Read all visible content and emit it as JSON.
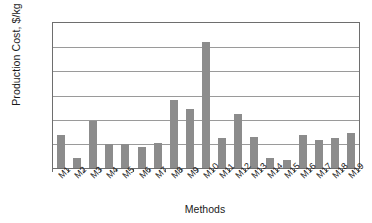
{
  "chart_data": {
    "type": "bar",
    "title": "",
    "subtitle": "",
    "xlabel": "Methods",
    "ylabel": "Production Cost, $/kg H2",
    "ylabel_prefix": "Production Cost, $/kg H",
    "ylabel_subscript": "2",
    "categories": [
      "M1",
      "M2",
      "M3",
      "M4",
      "M5",
      "M6",
      "M7",
      "M8",
      "M9",
      "M10",
      "M11",
      "M12",
      "M13",
      "M14",
      "M15",
      "M16",
      "M17",
      "M18",
      "M19"
    ],
    "values": [
      2.7,
      0.8,
      3.9,
      1.95,
      1.95,
      1.75,
      2.05,
      5.6,
      4.85,
      10.4,
      2.5,
      4.5,
      2.55,
      0.85,
      0.65,
      2.7,
      2.35,
      2.45,
      2.9
    ],
    "series": [
      {
        "name": "Production Cost",
        "values": [
          2.7,
          0.8,
          3.9,
          1.95,
          1.95,
          1.75,
          2.05,
          5.6,
          4.85,
          10.4,
          2.5,
          4.5,
          2.55,
          0.85,
          0.65,
          2.7,
          2.35,
          2.45,
          2.9
        ]
      }
    ],
    "ylim": [
      0,
      12
    ],
    "ytick_values": [
      0,
      2,
      4,
      6,
      8,
      10,
      12
    ],
    "ytick_labels": [
      "0.0",
      "2.0",
      "4.0",
      "6.0",
      "8.0",
      "10.0",
      "12.0"
    ],
    "grid": true,
    "grid_axis": "y",
    "legend": false,
    "legend_position": "none",
    "bar_color": "#8c8c8c",
    "axis_color": "#6e6e6e",
    "grid_color": "#9a9a9a",
    "background_color": "#ffffff",
    "xtick_label_rotation": -45
  }
}
